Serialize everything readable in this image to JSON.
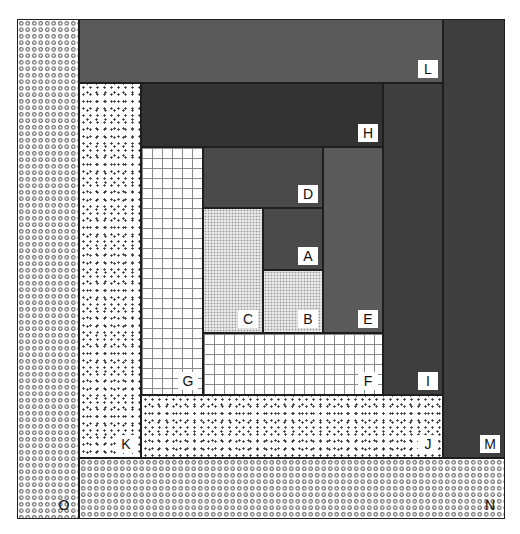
{
  "diagram": {
    "type": "nested-rectangles (log-cabin spiral)",
    "blocks": [
      {
        "id": "A",
        "label": "A",
        "pattern": "dark",
        "x": 263,
        "y": 208,
        "w": 60,
        "h": 62
      },
      {
        "id": "B",
        "label": "B",
        "pattern": "fine-dots",
        "x": 263,
        "y": 270,
        "w": 60,
        "h": 63
      },
      {
        "id": "C",
        "label": "C",
        "pattern": "fine-dots",
        "x": 203,
        "y": 208,
        "w": 60,
        "h": 125
      },
      {
        "id": "D",
        "label": "D",
        "pattern": "dark",
        "x": 203,
        "y": 147,
        "w": 120,
        "h": 61
      },
      {
        "id": "E",
        "label": "E",
        "pattern": "dark",
        "x": 323,
        "y": 147,
        "w": 60,
        "h": 186
      },
      {
        "id": "F",
        "label": "F",
        "pattern": "grid",
        "x": 203,
        "y": 333,
        "w": 180,
        "h": 62
      },
      {
        "id": "G",
        "label": "G",
        "pattern": "grid",
        "x": 141,
        "y": 147,
        "w": 62,
        "h": 248
      },
      {
        "id": "H",
        "label": "H",
        "pattern": "dark",
        "x": 141,
        "y": 83,
        "w": 242,
        "h": 64
      },
      {
        "id": "I",
        "label": "I",
        "pattern": "dark",
        "x": 383,
        "y": 83,
        "w": 60,
        "h": 312
      },
      {
        "id": "J",
        "label": "J",
        "pattern": "speckle",
        "x": 141,
        "y": 395,
        "w": 302,
        "h": 63
      },
      {
        "id": "K",
        "label": "K",
        "pattern": "speckle",
        "x": 79,
        "y": 83,
        "w": 62,
        "h": 375
      },
      {
        "id": "L",
        "label": "L",
        "pattern": "dark",
        "x": 79,
        "y": 19,
        "w": 364,
        "h": 64
      },
      {
        "id": "M",
        "label": "M",
        "pattern": "dark",
        "x": 443,
        "y": 19,
        "w": 62,
        "h": 439
      },
      {
        "id": "N",
        "label": "N",
        "pattern": "rings",
        "x": 79,
        "y": 458,
        "w": 426,
        "h": 61
      },
      {
        "id": "O",
        "label": "O",
        "pattern": "rings",
        "x": 17,
        "y": 19,
        "w": 62,
        "h": 500
      }
    ]
  }
}
